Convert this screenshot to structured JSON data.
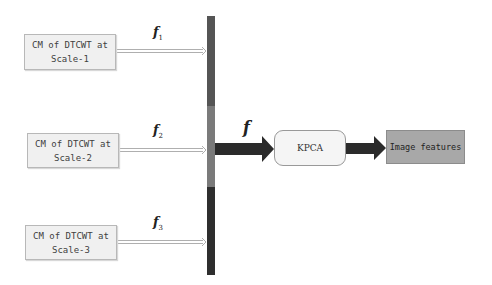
{
  "inputs": [
    {
      "line1": "CM of DTCWT at",
      "line2": "Scale-1",
      "feature_symbol": "f",
      "feature_index": "1"
    },
    {
      "line1": "CM of DTCWT at",
      "line2": "Scale-2",
      "feature_symbol": "f",
      "feature_index": "2"
    },
    {
      "line1": "CM of DTCWT at",
      "line2": "Scale-3",
      "feature_symbol": "f",
      "feature_index": "3"
    }
  ],
  "combined_feature": {
    "symbol": "f"
  },
  "kpca": {
    "label": "KPCA"
  },
  "output": {
    "label": "Image features"
  },
  "colors": {
    "bar_segment_1": "#555555",
    "bar_segment_2": "#7a7a7a",
    "bar_segment_3": "#2e2e2e",
    "thick_arrow": "#2b2b2b",
    "output_box": "#a8a8a8"
  }
}
